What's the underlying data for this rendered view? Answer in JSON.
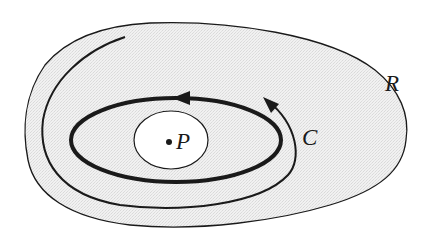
{
  "diagram": {
    "type": "region-contour-figure",
    "labels": {
      "region": "R",
      "contour": "C",
      "point": "P"
    },
    "colors": {
      "stroke": "#1a1a1a",
      "region_fill": "#efefef",
      "inner_hole_fill": "#ffffff",
      "background": "#ffffff"
    },
    "elements": [
      {
        "name": "region-R",
        "shape": "closed blob",
        "fill": "stippled gray"
      },
      {
        "name": "contour-C",
        "shape": "thick ellipse",
        "arrow_direction": "counterclockwise"
      },
      {
        "name": "hole-around-P",
        "shape": "small ellipse",
        "fill": "white"
      },
      {
        "name": "point-P",
        "shape": "dot"
      },
      {
        "name": "spiral-path",
        "shape": "open thin curve",
        "arrow_direction": "counterclockwise"
      }
    ]
  }
}
